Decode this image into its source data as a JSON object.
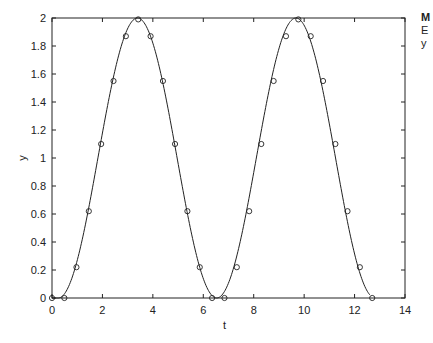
{
  "chart_data": {
    "type": "line",
    "title": "",
    "xlabel": "t",
    "ylabel": "y",
    "xlim": [
      0,
      14
    ],
    "ylim": [
      0,
      2
    ],
    "grid": false,
    "legend": null,
    "x_ticks": [
      "0",
      "2",
      "4",
      "6",
      "8",
      "10",
      "12",
      "14"
    ],
    "y_ticks": [
      "0",
      "0.2",
      "0.4",
      "0.6",
      "0.8",
      "1",
      "1.2",
      "1.4",
      "1.6",
      "1.8",
      "2"
    ],
    "series": [
      {
        "name": "curve",
        "style": "solid line",
        "description": "y = 1 - cos(t - 0.25), two full periods from t=0 to t≈12.6"
      },
      {
        "name": "samples",
        "style": "open circle markers",
        "x": [
          0,
          0.49,
          0.97,
          1.46,
          1.95,
          2.44,
          2.93,
          3.42,
          3.91,
          4.4,
          4.88,
          5.37,
          5.86,
          6.35,
          6.84,
          7.33,
          7.82,
          8.3,
          8.79,
          9.28,
          9.77,
          10.26,
          10.75,
          11.24,
          11.72,
          12.21,
          12.7
        ],
        "y": [
          0,
          0,
          0.22,
          0.62,
          1.1,
          1.55,
          1.87,
          1.99,
          1.87,
          1.55,
          1.1,
          0.62,
          0.22,
          0,
          0,
          0.22,
          0.62,
          1.1,
          1.55,
          1.87,
          1.99,
          1.87,
          1.55,
          1.1,
          0.62,
          0.22,
          0
        ]
      }
    ]
  },
  "edge_text": [
    "M",
    "E",
    "y"
  ]
}
